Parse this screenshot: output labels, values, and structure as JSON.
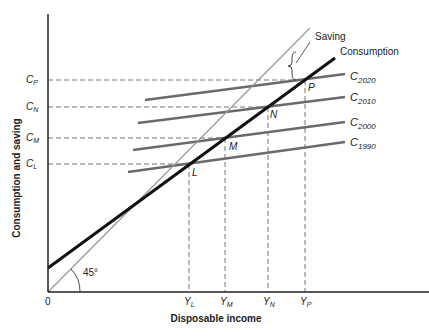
{
  "diagram": {
    "axes": {
      "x_label": "Disposable income",
      "y_label": "Consumption and saving",
      "origin_label": "0",
      "angle_label": "45°"
    },
    "curves": {
      "saving_label": "Saving",
      "consumption_label": "Consumption"
    },
    "short_run_curves": [
      {
        "base": "C",
        "sub": "2020"
      },
      {
        "base": "C",
        "sub": "2010"
      },
      {
        "base": "C",
        "sub": "2000"
      },
      {
        "base": "C",
        "sub": "1990"
      }
    ],
    "y_ticks": [
      {
        "base": "C",
        "sub": "P"
      },
      {
        "base": "C",
        "sub": "N"
      },
      {
        "base": "C",
        "sub": "M"
      },
      {
        "base": "C",
        "sub": "L"
      }
    ],
    "x_ticks": [
      {
        "base": "Y",
        "sub": "L"
      },
      {
        "base": "Y",
        "sub": "M"
      },
      {
        "base": "Y",
        "sub": "N"
      },
      {
        "base": "Y",
        "sub": "P"
      }
    ],
    "points": [
      "L",
      "M",
      "N",
      "P"
    ],
    "colors": {
      "consumption": "#111111",
      "forty_five": "#999999",
      "short_run": "#666666",
      "dashed": "#555555"
    }
  }
}
